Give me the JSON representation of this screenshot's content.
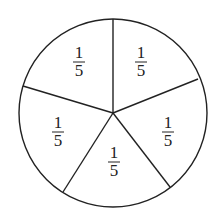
{
  "diagram": {
    "type": "pie",
    "title": "",
    "sectors": [
      {
        "label_num": "1",
        "label_den": "5",
        "position": "top-left"
      },
      {
        "label_num": "1",
        "label_den": "5",
        "position": "top-right"
      },
      {
        "label_num": "1",
        "label_den": "5",
        "position": "right"
      },
      {
        "label_num": "1",
        "label_den": "5",
        "position": "bottom"
      },
      {
        "label_num": "1",
        "label_den": "5",
        "position": "left"
      }
    ],
    "stroke_color": "#222222",
    "fill_color": "#ffffff"
  }
}
